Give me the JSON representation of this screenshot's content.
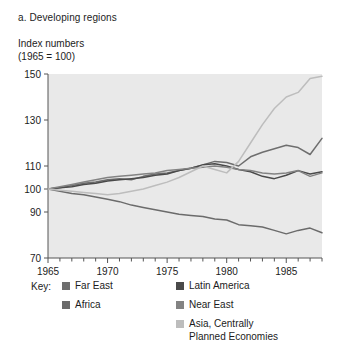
{
  "caption": "a. Developing regions",
  "axis_note": "Index numbers\n(1965 = 100)",
  "legend": {
    "key_label": "Key:",
    "items": [
      {
        "label": "Far East",
        "color": "#6e6e6e",
        "name": "legend-far-east"
      },
      {
        "label": "Africa",
        "color": "#6b6b6b",
        "name": "legend-africa"
      },
      {
        "label": "Latin America",
        "color": "#4a4a4a",
        "name": "legend-latin-america"
      },
      {
        "label": "Near East",
        "color": "#838383",
        "name": "legend-near-east"
      },
      {
        "label": "Asia, Centrally\nPlanned Economies",
        "color": "#bdbdbd",
        "name": "legend-asia-cpe"
      }
    ]
  },
  "chart_data": {
    "type": "line",
    "title": "a. Developing regions",
    "subtitle": "Index numbers (1965 = 100)",
    "xlabel": "",
    "ylabel": "Index numbers (1965 = 100)",
    "xlim": [
      1965,
      1988
    ],
    "ylim": [
      70,
      150
    ],
    "grid": false,
    "plot_background": "#e9e9e9",
    "legend_position": "below",
    "xticks": [
      1965,
      1970,
      1975,
      1980,
      1985
    ],
    "xtick_labels": [
      "1965",
      "1970",
      "1975",
      "1980",
      "1985"
    ],
    "xtick_minor_every": 1,
    "yticks": [
      70,
      90,
      100,
      110,
      130,
      150
    ],
    "ytick_labels": [
      "70",
      "90",
      "100",
      "110",
      "130",
      "150"
    ],
    "x": [
      1965,
      1966,
      1967,
      1968,
      1969,
      1970,
      1971,
      1972,
      1973,
      1974,
      1975,
      1976,
      1977,
      1978,
      1979,
      1980,
      1981,
      1982,
      1983,
      1984,
      1985,
      1986,
      1987,
      1988
    ],
    "series": [
      {
        "name": "Far East",
        "color": "#6e6e6e",
        "values": [
          100,
          100.5,
          101.5,
          102.5,
          103,
          104,
          104.5,
          104,
          105.5,
          106.5,
          107,
          108,
          109,
          110.5,
          112,
          111.5,
          110,
          114,
          116,
          117.5,
          119,
          118,
          115,
          122
        ]
      },
      {
        "name": "Africa",
        "color": "#6b6b6b",
        "values": [
          100,
          99,
          98,
          97.5,
          96.5,
          95.5,
          94.5,
          93,
          92,
          91,
          90,
          89,
          88.5,
          88,
          87,
          86.5,
          84.5,
          84,
          83.5,
          82,
          80.5,
          82,
          83,
          81
        ]
      },
      {
        "name": "Latin America",
        "color": "#4a4a4a",
        "values": [
          100,
          100.5,
          101,
          102,
          102.5,
          103.5,
          104,
          104.5,
          105,
          106,
          106.5,
          108,
          109,
          110.5,
          111,
          110,
          108.5,
          107.5,
          105.5,
          104.5,
          106,
          108,
          106.5,
          107.5
        ]
      },
      {
        "name": "Near East",
        "color": "#838383",
        "values": [
          100,
          101,
          102,
          103,
          104,
          105,
          105.5,
          106,
          106.5,
          107,
          108,
          108.5,
          109,
          109.5,
          110,
          109.5,
          108.5,
          108,
          107,
          106.5,
          107,
          108,
          105.5,
          107
        ]
      },
      {
        "name": "Asia, Centrally Planned Economies",
        "color": "#bdbdbd",
        "values": [
          100,
          99.5,
          99,
          98.5,
          98,
          97.5,
          98,
          99,
          100,
          101.5,
          103,
          105,
          107.5,
          110,
          108.5,
          107,
          112,
          120,
          128,
          135,
          140,
          142,
          148,
          149
        ]
      }
    ]
  }
}
